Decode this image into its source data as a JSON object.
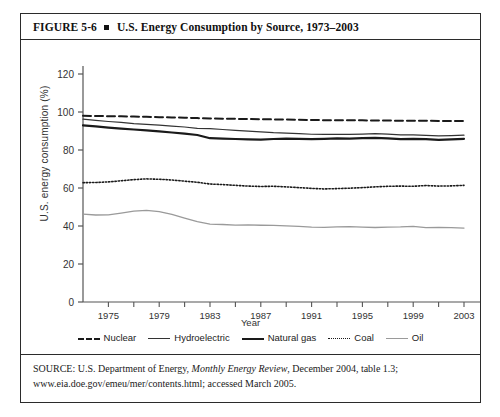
{
  "figure": {
    "number": "FIGURE  5-6",
    "bullet": "square-bullet",
    "title": "U.S. Energy Consumption by Source, 1973–2003"
  },
  "source": {
    "line1_prefix": "SOURCE: U.S. Department of Energy, ",
    "line1_italic": "Monthly Energy Review",
    "line1_suffix": ", December 2004, table 1.3;",
    "line2": "www.eia.doe.gov/emeu/mer/contents.html; accessed March 2005."
  },
  "chart_data": {
    "type": "line",
    "title": "U.S. Energy Consumption by Source, 1973–2003",
    "xlabel": "Year",
    "ylabel": "U.S. energy consumption (%)",
    "xlim": [
      1973,
      2003
    ],
    "ylim": [
      0,
      120
    ],
    "yticks": [
      0,
      20,
      40,
      60,
      80,
      100,
      120
    ],
    "xticks": [
      1975,
      1979,
      1983,
      1987,
      1991,
      1995,
      1999,
      2003
    ],
    "xticks_minor": [
      1977,
      1981,
      1985,
      1989,
      1993,
      1997,
      2001
    ],
    "grid": false,
    "legend_position": "below",
    "x": [
      1973,
      1974,
      1975,
      1976,
      1977,
      1978,
      1979,
      1980,
      1981,
      1982,
      1983,
      1984,
      1985,
      1986,
      1987,
      1988,
      1989,
      1990,
      1991,
      1992,
      1993,
      1994,
      1995,
      1996,
      1997,
      1998,
      1999,
      2000,
      2001,
      2002,
      2003
    ],
    "series": [
      {
        "name": "Nuclear",
        "style": "dashed",
        "color": "#1a1a1a",
        "width": 2.0,
        "values": [
          98.0,
          97.9,
          97.8,
          97.7,
          97.6,
          97.5,
          97.3,
          97.1,
          97.0,
          96.8,
          96.6,
          96.5,
          96.4,
          96.3,
          96.2,
          96.1,
          96.0,
          95.9,
          95.8,
          95.7,
          95.7,
          95.6,
          95.6,
          95.5,
          95.5,
          95.4,
          95.4,
          95.4,
          95.3,
          95.3,
          95.3
        ]
      },
      {
        "name": "Hydroelectric",
        "style": "solid-thin",
        "color": "#333333",
        "width": 1.2,
        "values": [
          96.2,
          95.6,
          95.0,
          94.5,
          93.9,
          93.5,
          93.1,
          92.6,
          92.1,
          91.4,
          91.2,
          90.8,
          90.3,
          89.9,
          89.5,
          89.1,
          88.9,
          88.6,
          88.3,
          88.2,
          88.3,
          88.2,
          88.4,
          88.6,
          88.4,
          88.0,
          88.0,
          87.7,
          87.4,
          87.6,
          87.8
        ]
      },
      {
        "name": "Natural gas",
        "style": "solid-thick",
        "color": "#1a1a1a",
        "width": 2.2,
        "values": [
          93.0,
          92.4,
          91.8,
          91.3,
          90.8,
          90.3,
          89.8,
          89.2,
          88.6,
          87.9,
          86.2,
          86.0,
          85.8,
          85.6,
          85.5,
          85.8,
          86.0,
          85.9,
          85.7,
          85.9,
          86.1,
          86.0,
          86.2,
          86.4,
          86.1,
          85.7,
          85.9,
          85.7,
          85.3,
          85.6,
          85.9
        ]
      },
      {
        "name": "Coal",
        "style": "dotted",
        "color": "#1a1a1a",
        "width": 1.6,
        "values": [
          62.8,
          62.9,
          63.2,
          63.8,
          64.4,
          64.8,
          64.6,
          64.2,
          63.6,
          63.0,
          62.1,
          61.8,
          61.4,
          61.0,
          60.8,
          60.9,
          60.6,
          60.2,
          59.8,
          59.5,
          59.7,
          59.9,
          60.2,
          60.6,
          60.9,
          61.0,
          60.9,
          61.3,
          61.0,
          61.1,
          61.4
        ]
      },
      {
        "name": "Oil",
        "style": "solid-thin",
        "color": "#9a9a9a",
        "width": 1.3,
        "values": [
          46.2,
          45.8,
          45.9,
          46.8,
          47.8,
          48.2,
          47.6,
          46.1,
          44.2,
          42.3,
          41.0,
          40.8,
          40.5,
          40.6,
          40.4,
          40.3,
          40.1,
          39.8,
          39.4,
          39.3,
          39.5,
          39.7,
          39.4,
          39.2,
          39.4,
          39.5,
          39.8,
          39.1,
          39.3,
          39.1,
          38.9
        ]
      }
    ]
  }
}
